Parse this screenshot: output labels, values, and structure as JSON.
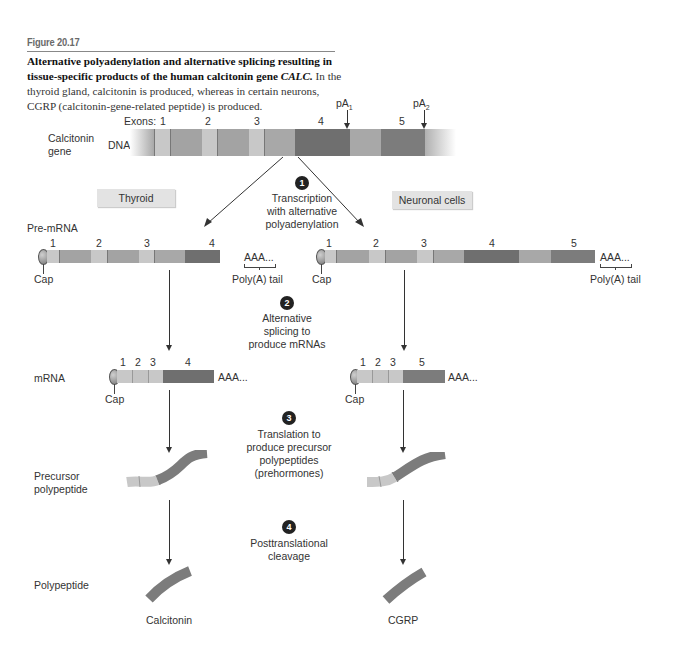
{
  "figure": {
    "label": "Figure 20.17",
    "caption_bold": "Alternative polyadenylation and alternative splicing resulting in tissue-specific products of the human calcitonin gene",
    "caption_gene": "CALC.",
    "caption_text": " In the thyroid gland, calcitonin is produced, whereas in certain neurons, CGRP (calcitonin-gene-related peptide) is produced."
  },
  "dna": {
    "row_label_line1": "Calcitonin",
    "row_label_line2": "gene",
    "type_label": "DNA",
    "exons_label": "Exons:",
    "exon_numbers": [
      "1",
      "2",
      "3",
      "4",
      "5"
    ],
    "polya_sites": [
      {
        "base": "pA",
        "sub": "1"
      },
      {
        "base": "pA",
        "sub": "2"
      }
    ]
  },
  "tissues": {
    "left": "Thyroid",
    "right": "Neuronal cells"
  },
  "steps": [
    {
      "number": "1",
      "text_lines": [
        "Transcription",
        "with alternative",
        "polyadenylation"
      ]
    },
    {
      "number": "2",
      "text_lines": [
        "Alternative",
        "splicing to",
        "produce mRNAs"
      ]
    },
    {
      "number": "3",
      "text_lines": [
        "Translation to",
        "produce precursor",
        "polypeptides",
        "(prehormones)"
      ]
    },
    {
      "number": "4",
      "text_lines": [
        "Posttranslational",
        "cleavage"
      ]
    }
  ],
  "rows": {
    "pre_mrna": "Pre-mRNA",
    "mrna": "mRNA",
    "precursor_line1": "Precursor",
    "precursor_line2": "polypeptide",
    "polypeptide": "Polypeptide"
  },
  "pre_mrna": {
    "left_exons": [
      "1",
      "2",
      "3",
      "4"
    ],
    "right_exons": [
      "1",
      "2",
      "3",
      "4",
      "5"
    ],
    "tail": "AAA...",
    "tail_label": "Poly(A) tail",
    "cap_label": "Cap"
  },
  "mrna": {
    "left_exons": [
      "1",
      "2",
      "3",
      "4"
    ],
    "right_exons": [
      "1",
      "2",
      "3",
      "5"
    ],
    "tail": "AAA...",
    "cap_label": "Cap"
  },
  "products": {
    "left": "Calcitonin",
    "right": "CGRP"
  },
  "colors": {
    "exon_light": "#c8c8c8",
    "intron_mid": "#a6a6a6",
    "exon4_dark": "#6f6f6f",
    "exon5_dark": "#7c7c7c",
    "step_circle": "#222222",
    "tag_bg": "#e3e3e3"
  }
}
